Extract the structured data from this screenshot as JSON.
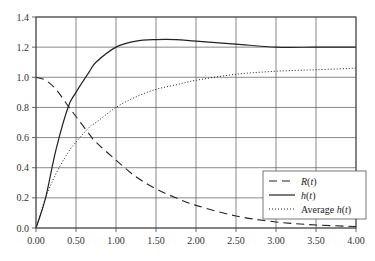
{
  "chart_data": {
    "type": "line",
    "title": "",
    "xlabel": "",
    "ylabel": "",
    "xlim": [
      0,
      4
    ],
    "ylim": [
      0,
      1.4
    ],
    "x_ticks": [
      "0.00",
      "0.50",
      "1.00",
      "1.50",
      "2.00",
      "2.50",
      "3.00",
      "3.50",
      "4.00"
    ],
    "y_ticks": [
      "0.0",
      "0.2",
      "0.4",
      "0.6",
      "0.8",
      "1.0",
      "1.2",
      "1.4"
    ],
    "grid": true,
    "legend_position": "lower right",
    "x": [
      0,
      0.12,
      0.25,
      0.4,
      0.5,
      0.67,
      0.75,
      1.0,
      1.25,
      1.5,
      1.75,
      2.0,
      2.5,
      3.0,
      3.5,
      4.0
    ],
    "series": [
      {
        "name": "R(t)",
        "style": "dashed",
        "values": [
          1.0,
          0.98,
          0.92,
          0.81,
          0.74,
          0.62,
          0.57,
          0.45,
          0.34,
          0.26,
          0.2,
          0.15,
          0.08,
          0.04,
          0.02,
          0.01
        ]
      },
      {
        "name": "h(t)",
        "style": "solid",
        "values": [
          0.0,
          0.2,
          0.52,
          0.8,
          0.9,
          1.04,
          1.1,
          1.2,
          1.24,
          1.25,
          1.25,
          1.24,
          1.22,
          1.2,
          1.2,
          1.2
        ]
      },
      {
        "name": "Average h(t)",
        "style": "dotted",
        "values": [
          0.0,
          0.2,
          0.36,
          0.5,
          0.57,
          0.67,
          0.7,
          0.8,
          0.87,
          0.92,
          0.95,
          0.98,
          1.02,
          1.04,
          1.05,
          1.06
        ]
      }
    ]
  },
  "legend": {
    "items": [
      {
        "label_main": "R",
        "label_arg": "(t)",
        "prefix": ""
      },
      {
        "label_main": "h",
        "label_arg": "(t)",
        "prefix": ""
      },
      {
        "label_main": "h",
        "label_arg": "(t)",
        "prefix": "Average "
      }
    ]
  }
}
